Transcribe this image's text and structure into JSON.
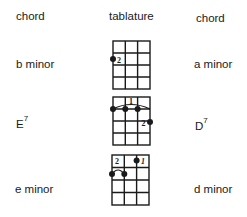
{
  "headers": {
    "left": "chord",
    "center": "tablature",
    "right": "chord"
  },
  "rows": [
    {
      "left_chord": {
        "name": "b minor",
        "sup": ""
      },
      "right_chord": {
        "name": "a minor",
        "sup": ""
      },
      "tab": {
        "strings": 4,
        "frets": 4,
        "dots": [
          {
            "string": 0,
            "fret": 2,
            "finger": "2",
            "label_side": "right"
          }
        ],
        "barre": null
      }
    },
    {
      "left_chord": {
        "name": "E",
        "sup": "7"
      },
      "right_chord": {
        "name": "D",
        "sup": "7"
      },
      "tab": {
        "strings": 4,
        "frets": 4,
        "dots": [
          {
            "string": 0,
            "fret": 1
          },
          {
            "string": 1,
            "fret": 1
          },
          {
            "string": 2,
            "fret": 1
          },
          {
            "string": 3,
            "fret": 2,
            "finger": "2",
            "label_side": "left"
          }
        ],
        "barre": {
          "from_string": 0,
          "to_string": 3,
          "fret": 1,
          "finger": "1"
        }
      }
    },
    {
      "left_chord": {
        "name": "e minor",
        "sup": ""
      },
      "right_chord": {
        "name": "d minor",
        "sup": ""
      },
      "tab": {
        "strings": 4,
        "frets": 4,
        "dots": [
          {
            "string": 0,
            "fret": 2
          },
          {
            "string": 1,
            "fret": 2
          },
          {
            "string": 2,
            "fret": 1,
            "finger": "1",
            "label_side": "right"
          }
        ],
        "barre": {
          "from_string": 0,
          "to_string": 1,
          "fret": 2,
          "finger": "2",
          "arc_only": true
        }
      }
    }
  ]
}
